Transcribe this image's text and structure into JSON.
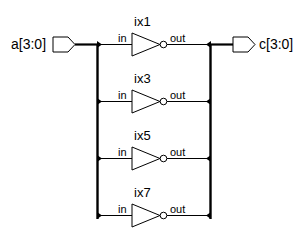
{
  "diagram": {
    "type": "schematic",
    "colors": {
      "line": "#000000",
      "background": "#ffffff",
      "port_fill": "#ffffff"
    },
    "input_port": {
      "label": "a[3:0]"
    },
    "output_port": {
      "label": "c[3:0]"
    },
    "instances": [
      {
        "name": "ix1",
        "in_label": "in",
        "out_label": "out"
      },
      {
        "name": "ix3",
        "in_label": "in",
        "out_label": "out"
      },
      {
        "name": "ix5",
        "in_label": "in",
        "out_label": "out"
      },
      {
        "name": "ix7",
        "in_label": "in",
        "out_label": "out"
      }
    ]
  }
}
